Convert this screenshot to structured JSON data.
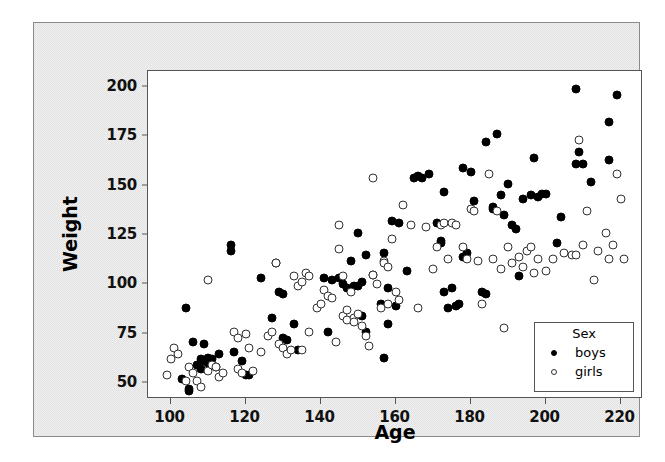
{
  "chart_data": {
    "type": "scatter",
    "title": "",
    "xlabel": "Age",
    "ylabel": "Weight",
    "xlim": [
      94,
      226
    ],
    "ylim": [
      42,
      208
    ],
    "xticks": [
      100,
      120,
      140,
      160,
      180,
      200,
      220
    ],
    "yticks": [
      50,
      75,
      100,
      125,
      150,
      175,
      200
    ],
    "grid": false,
    "legend": {
      "title": "Sex",
      "position": "bottom-right",
      "entries": [
        {
          "name": "boys",
          "marker": "filled-circle",
          "color": "#000000"
        },
        {
          "name": "girls",
          "marker": "open-circle",
          "color": "#ffffff"
        }
      ]
    },
    "series": [
      {
        "name": "boys",
        "marker": "filled-circle",
        "color": "#000000",
        "points": [
          [
            103,
            52
          ],
          [
            105,
            47
          ],
          [
            105,
            46
          ],
          [
            104,
            88
          ],
          [
            106,
            71
          ],
          [
            107,
            59
          ],
          [
            108,
            57
          ],
          [
            108,
            62
          ],
          [
            109,
            61
          ],
          [
            109,
            70
          ],
          [
            110,
            63
          ],
          [
            110,
            60
          ],
          [
            111,
            62
          ],
          [
            112,
            58
          ],
          [
            113,
            65
          ],
          [
            116,
            120
          ],
          [
            116,
            117
          ],
          [
            117,
            66
          ],
          [
            119,
            61
          ],
          [
            120,
            54
          ],
          [
            121,
            54
          ],
          [
            124,
            103
          ],
          [
            127,
            83
          ],
          [
            128,
            111
          ],
          [
            129,
            96
          ],
          [
            130,
            95
          ],
          [
            130,
            73
          ],
          [
            131,
            72
          ],
          [
            133,
            80
          ],
          [
            134,
            67
          ],
          [
            141,
            103
          ],
          [
            142,
            76
          ],
          [
            143,
            102
          ],
          [
            145,
            103
          ],
          [
            146,
            100
          ],
          [
            147,
            98
          ],
          [
            148,
            112
          ],
          [
            149,
            99
          ],
          [
            150,
            99
          ],
          [
            150,
            126
          ],
          [
            151,
            101
          ],
          [
            151,
            84
          ],
          [
            152,
            115
          ],
          [
            152,
            76
          ],
          [
            154,
            105
          ],
          [
            156,
            90
          ],
          [
            157,
            63
          ],
          [
            157,
            116
          ],
          [
            158,
            98
          ],
          [
            158,
            80
          ],
          [
            159,
            132
          ],
          [
            160,
            89
          ],
          [
            161,
            131
          ],
          [
            163,
            107
          ],
          [
            165,
            154
          ],
          [
            166,
            155
          ],
          [
            167,
            154
          ],
          [
            169,
            156
          ],
          [
            171,
            131
          ],
          [
            172,
            122
          ],
          [
            172,
            121
          ],
          [
            173,
            147
          ],
          [
            173,
            96
          ],
          [
            174,
            88
          ],
          [
            175,
            98
          ],
          [
            176,
            89
          ],
          [
            177,
            90
          ],
          [
            178,
            159
          ],
          [
            178,
            114
          ],
          [
            179,
            116
          ],
          [
            180,
            157
          ],
          [
            181,
            142
          ],
          [
            183,
            96
          ],
          [
            184,
            95
          ],
          [
            184,
            172
          ],
          [
            186,
            138
          ],
          [
            186,
            139
          ],
          [
            187,
            176
          ],
          [
            188,
            145
          ],
          [
            189,
            135
          ],
          [
            190,
            151
          ],
          [
            191,
            130
          ],
          [
            192,
            128
          ],
          [
            193,
            104
          ],
          [
            194,
            143
          ],
          [
            196,
            145
          ],
          [
            197,
            164
          ],
          [
            198,
            144
          ],
          [
            199,
            146
          ],
          [
            200,
            146
          ],
          [
            203,
            121
          ],
          [
            204,
            134
          ],
          [
            208,
            199
          ],
          [
            208,
            161
          ],
          [
            209,
            167
          ],
          [
            210,
            161
          ],
          [
            212,
            152
          ],
          [
            217,
            182
          ],
          [
            217,
            163
          ],
          [
            219,
            196
          ]
        ]
      },
      {
        "name": "girls",
        "marker": "open-circle",
        "color": "#ffffff",
        "points": [
          [
            99,
            54
          ],
          [
            100,
            62
          ],
          [
            101,
            68
          ],
          [
            102,
            65
          ],
          [
            104,
            51
          ],
          [
            105,
            58
          ],
          [
            106,
            55
          ],
          [
            107,
            51
          ],
          [
            108,
            48
          ],
          [
            110,
            56
          ],
          [
            110,
            102
          ],
          [
            111,
            59
          ],
          [
            112,
            58
          ],
          [
            113,
            53
          ],
          [
            114,
            55
          ],
          [
            117,
            76
          ],
          [
            118,
            73
          ],
          [
            118,
            57
          ],
          [
            119,
            55
          ],
          [
            120,
            75
          ],
          [
            121,
            68
          ],
          [
            122,
            56
          ],
          [
            124,
            66
          ],
          [
            126,
            74
          ],
          [
            127,
            76
          ],
          [
            128,
            111
          ],
          [
            129,
            70
          ],
          [
            130,
            68
          ],
          [
            131,
            65
          ],
          [
            132,
            67
          ],
          [
            133,
            104
          ],
          [
            134,
            99
          ],
          [
            135,
            101
          ],
          [
            135,
            67
          ],
          [
            136,
            106
          ],
          [
            137,
            104
          ],
          [
            137,
            76
          ],
          [
            139,
            88
          ],
          [
            140,
            90
          ],
          [
            141,
            97
          ],
          [
            142,
            94
          ],
          [
            143,
            93
          ],
          [
            144,
            71
          ],
          [
            145,
            130
          ],
          [
            145,
            118
          ],
          [
            146,
            104
          ],
          [
            146,
            84
          ],
          [
            147,
            87
          ],
          [
            147,
            82
          ],
          [
            148,
            96
          ],
          [
            149,
            83
          ],
          [
            149,
            81
          ],
          [
            150,
            85
          ],
          [
            151,
            79
          ],
          [
            152,
            74
          ],
          [
            153,
            69
          ],
          [
            154,
            154
          ],
          [
            154,
            105
          ],
          [
            155,
            100
          ],
          [
            156,
            88
          ],
          [
            157,
            112
          ],
          [
            157,
            111
          ],
          [
            158,
            109
          ],
          [
            158,
            90
          ],
          [
            159,
            123
          ],
          [
            160,
            96
          ],
          [
            161,
            92
          ],
          [
            162,
            140
          ],
          [
            164,
            130
          ],
          [
            166,
            88
          ],
          [
            168,
            129
          ],
          [
            170,
            108
          ],
          [
            171,
            119
          ],
          [
            172,
            130
          ],
          [
            173,
            131
          ],
          [
            174,
            113
          ],
          [
            175,
            131
          ],
          [
            176,
            130
          ],
          [
            178,
            119
          ],
          [
            179,
            113
          ],
          [
            180,
            138
          ],
          [
            181,
            137
          ],
          [
            182,
            112
          ],
          [
            183,
            90
          ],
          [
            185,
            156
          ],
          [
            186,
            113
          ],
          [
            187,
            137
          ],
          [
            188,
            108
          ],
          [
            189,
            78
          ],
          [
            190,
            119
          ],
          [
            191,
            111
          ],
          [
            193,
            114
          ],
          [
            194,
            109
          ],
          [
            195,
            117
          ],
          [
            196,
            119
          ],
          [
            197,
            106
          ],
          [
            198,
            113
          ],
          [
            200,
            107
          ],
          [
            202,
            113
          ],
          [
            205,
            116
          ],
          [
            207,
            115
          ],
          [
            208,
            115
          ],
          [
            209,
            173
          ],
          [
            210,
            120
          ],
          [
            211,
            137
          ],
          [
            213,
            102
          ],
          [
            214,
            117
          ],
          [
            216,
            126
          ],
          [
            217,
            113
          ],
          [
            218,
            120
          ],
          [
            219,
            156
          ],
          [
            220,
            143
          ],
          [
            221,
            113
          ]
        ]
      }
    ]
  },
  "axes": {
    "x_title": "Age",
    "y_title": "Weight",
    "x_tick_labels": [
      "100",
      "120",
      "140",
      "160",
      "180",
      "200",
      "220"
    ],
    "y_tick_labels": [
      "50",
      "75",
      "100",
      "125",
      "150",
      "175",
      "200"
    ]
  },
  "legend": {
    "title": "Sex",
    "items": [
      {
        "label": "boys"
      },
      {
        "label": "girls"
      }
    ]
  }
}
